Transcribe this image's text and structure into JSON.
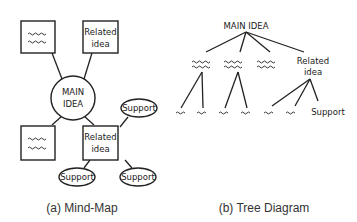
{
  "mind_map": {
    "caption": "(a) Mind-Map",
    "center": "MAIN IDEA",
    "center_lines": [
      "MAIN",
      "IDEA"
    ],
    "nodes": [
      {
        "position": "top-left",
        "type": "box",
        "content": "placeholder-squiggle"
      },
      {
        "position": "top-right",
        "type": "box",
        "lines": [
          "Related",
          "idea"
        ]
      },
      {
        "position": "bottom-left",
        "type": "box",
        "content": "placeholder-squiggle"
      },
      {
        "position": "bottom-right",
        "type": "box",
        "lines": [
          "Related",
          "idea"
        ],
        "supports": [
          "Support",
          "Support",
          "Support"
        ]
      }
    ]
  },
  "tree_diagram": {
    "caption": "(b) Tree Diagram",
    "root": "MAIN IDEA",
    "level1": [
      {
        "content": "placeholder-squiggle",
        "children": [
          "squiggle",
          "squiggle"
        ]
      },
      {
        "content": "placeholder-squiggle",
        "children": [
          "squiggle",
          "squiggle"
        ]
      },
      {
        "content": "placeholder-squiggle",
        "children": []
      },
      {
        "lines": [
          "Related",
          "idea"
        ],
        "children": [
          "squiggle",
          "squiggle",
          "Support"
        ]
      }
    ]
  },
  "labels": {
    "related": "Related",
    "idea": "idea",
    "support": "Support"
  }
}
